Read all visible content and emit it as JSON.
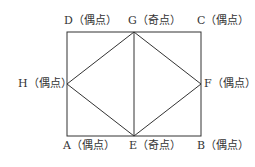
{
  "diagram": {
    "type": "graph",
    "nodes": [
      {
        "id": "D",
        "label": "D（偶点）",
        "x": 67,
        "y": 32
      },
      {
        "id": "G",
        "label": "G（奇点）",
        "x": 134,
        "y": 32
      },
      {
        "id": "C",
        "label": "C（偶点）",
        "x": 201,
        "y": 32
      },
      {
        "id": "H",
        "label": "H（偶点）",
        "x": 67,
        "y": 84
      },
      {
        "id": "F",
        "label": "F（偶点）",
        "x": 201,
        "y": 84
      },
      {
        "id": "A",
        "label": "A（偶点）",
        "x": 67,
        "y": 136
      },
      {
        "id": "E",
        "label": "E（奇点）",
        "x": 134,
        "y": 136
      },
      {
        "id": "B",
        "label": "B（偶点）",
        "x": 201,
        "y": 136
      }
    ],
    "edges": [
      [
        "D",
        "G"
      ],
      [
        "G",
        "C"
      ],
      [
        "C",
        "F"
      ],
      [
        "F",
        "B"
      ],
      [
        "B",
        "E"
      ],
      [
        "E",
        "A"
      ],
      [
        "A",
        "H"
      ],
      [
        "H",
        "D"
      ],
      [
        "G",
        "E"
      ],
      [
        "G",
        "H"
      ],
      [
        "G",
        "F"
      ],
      [
        "H",
        "E"
      ],
      [
        "F",
        "E"
      ]
    ],
    "labels": {
      "D": "D（偶点）",
      "G": "G（奇点）",
      "C": "C（偶点）",
      "H": "H（偶点）",
      "F": "F（偶点）",
      "A": "A（偶点）",
      "E": "E（奇点）",
      "B": "B（偶点）"
    }
  }
}
